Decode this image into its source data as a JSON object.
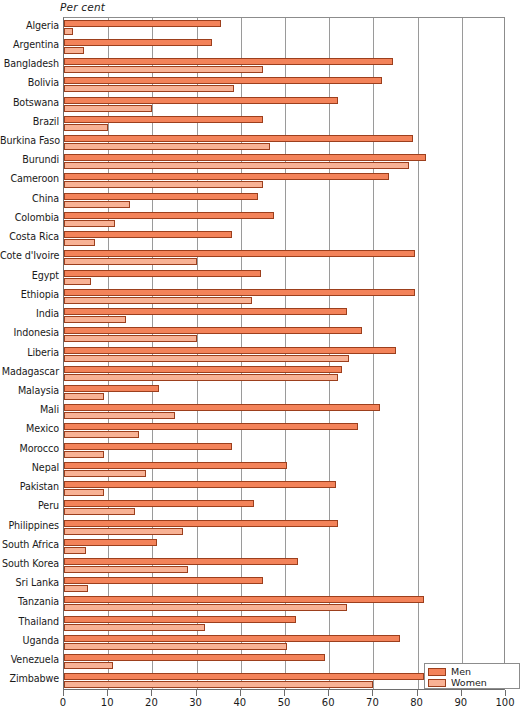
{
  "chart_data": {
    "type": "bar",
    "orientation": "horizontal",
    "title": "",
    "xlabel": "Per cent",
    "ylabel": "",
    "xlim": [
      0,
      100
    ],
    "xticks": [
      0,
      10,
      20,
      30,
      40,
      50,
      60,
      70,
      80,
      90,
      100
    ],
    "xtick_labels": [
      "0",
      "10",
      "20",
      "30",
      "40",
      "50",
      "60",
      "70",
      "80",
      "90",
      "100"
    ],
    "grid": "vertical",
    "legend_position": "bottom-right",
    "colors": {
      "men": "#f3835a",
      "women": "#f8b295",
      "bar_outline": "#9c3f1d",
      "grid": "#9a9a9a",
      "axis": "#6e6e6e"
    },
    "categories": [
      "Algeria",
      "Argentina",
      "Bangladesh",
      "Bolivia",
      "Botswana",
      "Brazil",
      "Burkina Faso",
      "Burundi",
      "Cameroon",
      "China",
      "Colombia",
      "Costa Rica",
      "Cote d'Ivoire",
      "Egypt",
      "Ethiopia",
      "India",
      "Indonesia",
      "Liberia",
      "Madagascar",
      "Malaysia",
      "Mali",
      "Mexico",
      "Morocco",
      "Nepal",
      "Pakistan",
      "Peru",
      "Philippines",
      "South Africa",
      "South Korea",
      "Sri Lanka",
      "Tanzania",
      "Thailand",
      "Uganda",
      "Venezuela",
      "Zimbabwe"
    ],
    "series": [
      {
        "name": "Men",
        "color": "#f3835a",
        "values": [
          35.5,
          33.5,
          74.5,
          72,
          62,
          45,
          79,
          82,
          73.5,
          44,
          47.5,
          38,
          79.5,
          44.5,
          79.5,
          64,
          67.5,
          75,
          63,
          21.5,
          71.5,
          66.5,
          38,
          50.5,
          61.5,
          43,
          62,
          21,
          53,
          45,
          81.5,
          52.5,
          76,
          59,
          81.5
        ]
      },
      {
        "name": "Women",
        "color": "#f8b295",
        "values": [
          2,
          4.5,
          45,
          38.5,
          20,
          10,
          46.5,
          78,
          45,
          15,
          11.5,
          7,
          30,
          6,
          42.5,
          14,
          30,
          64.5,
          62,
          9,
          25,
          17,
          9,
          18.5,
          9,
          16,
          27,
          5,
          28,
          5.5,
          64,
          32,
          50.5,
          11,
          70
        ]
      }
    ]
  },
  "legend": {
    "items": [
      {
        "label": "Men",
        "key": "men"
      },
      {
        "label": "Women",
        "key": "women"
      }
    ]
  }
}
